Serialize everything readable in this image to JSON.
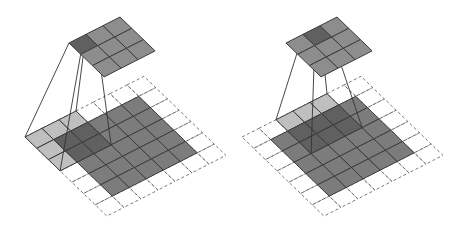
{
  "figure": {
    "colors": {
      "input_cell": "#7c7c7c",
      "kernel_over_input": "#5f5f5f",
      "kernel_over_padding": "#bcbcbc",
      "output_cell": "#8d8d8d",
      "output_active": "#606060",
      "grid_line": "#3c3c3c",
      "padding_dash": "#6a6a6a",
      "projection_line": "#333333"
    },
    "panels": [
      {
        "name": "step-1",
        "offset_x": 0,
        "input_size": 5,
        "padding": 1,
        "kernel_size": 3,
        "kernel_pos": {
          "u": 0,
          "v": 0
        },
        "output_size": 3,
        "output_active": {
          "u": 0,
          "v": 0
        }
      },
      {
        "name": "step-2",
        "offset_x": 217,
        "input_size": 5,
        "padding": 1,
        "kernel_size": 3,
        "kernel_pos": {
          "u": 2,
          "v": 0
        },
        "output_size": 3,
        "output_active": {
          "u": 1,
          "v": 0
        }
      }
    ]
  }
}
